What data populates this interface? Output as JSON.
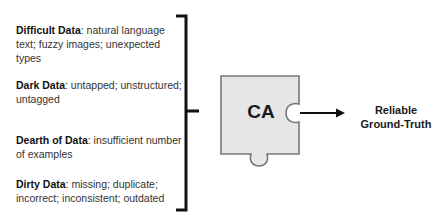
{
  "items": [
    {
      "title": "Difficult Data",
      "desc": ": natural language text; fuzzy images; unexpected types"
    },
    {
      "title": "Dark Data",
      "desc": ": untapped; unstructured; untagged"
    },
    {
      "title": "Dearth of Data",
      "desc": ": insufficient number of examples"
    },
    {
      "title": "Dirty Data",
      "desc": ": missing; duplicate; incorrect; inconsistent; outdated"
    }
  ],
  "puzzle": {
    "label": "CA",
    "fill": "#e6e6e6",
    "stroke": "#777777"
  },
  "output": {
    "line1": "Reliable",
    "line2": "Ground-Truth"
  }
}
